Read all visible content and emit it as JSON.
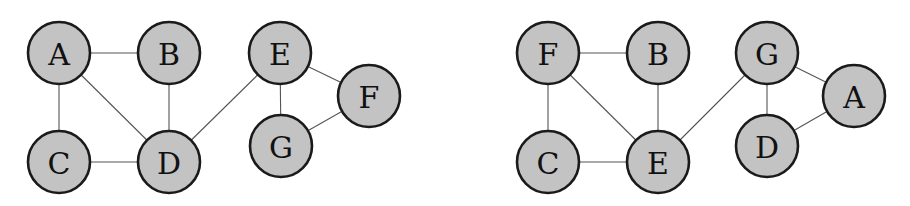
{
  "graphs": [
    {
      "name": "graph-left",
      "nodes": [
        "A",
        "B",
        "C",
        "D",
        "E",
        "F",
        "G"
      ],
      "edges": [
        [
          "A",
          "B"
        ],
        [
          "A",
          "C"
        ],
        [
          "A",
          "D"
        ],
        [
          "B",
          "D"
        ],
        [
          "C",
          "D"
        ],
        [
          "D",
          "E"
        ],
        [
          "E",
          "F"
        ],
        [
          "E",
          "G"
        ],
        [
          "G",
          "F"
        ]
      ]
    },
    {
      "name": "graph-right",
      "nodes": [
        "F",
        "B",
        "C",
        "E",
        "G",
        "A",
        "D"
      ],
      "edges": [
        [
          "F",
          "B"
        ],
        [
          "F",
          "C"
        ],
        [
          "F",
          "E"
        ],
        [
          "B",
          "E"
        ],
        [
          "C",
          "E"
        ],
        [
          "E",
          "G"
        ],
        [
          "G",
          "A"
        ],
        [
          "G",
          "D"
        ],
        [
          "D",
          "A"
        ]
      ]
    }
  ],
  "colors": {
    "node_fill": "#c3c3c3",
    "node_stroke": "#1a1a1a",
    "edge": "#555555",
    "label": "#111111"
  }
}
